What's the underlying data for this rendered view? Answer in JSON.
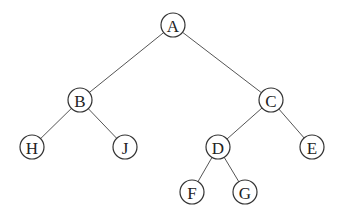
{
  "diagram": {
    "type": "binary-tree",
    "colors": {
      "edge": "#555555",
      "node_stroke": "#333333",
      "node_fill": "#ffffff",
      "text": "#222222"
    },
    "nodes": [
      {
        "id": "A",
        "label": "A",
        "x": 173,
        "y": 25
      },
      {
        "id": "B",
        "label": "B",
        "x": 80,
        "y": 100
      },
      {
        "id": "C",
        "label": "C",
        "x": 271,
        "y": 100
      },
      {
        "id": "H",
        "label": "H",
        "x": 32,
        "y": 147
      },
      {
        "id": "J",
        "label": "J",
        "x": 125,
        "y": 147
      },
      {
        "id": "D",
        "label": "D",
        "x": 218,
        "y": 147
      },
      {
        "id": "E",
        "label": "E",
        "x": 312,
        "y": 147
      },
      {
        "id": "F",
        "label": "F",
        "x": 192,
        "y": 192
      },
      {
        "id": "G",
        "label": "G",
        "x": 245,
        "y": 192
      }
    ],
    "edges": [
      [
        "A",
        "B"
      ],
      [
        "A",
        "C"
      ],
      [
        "B",
        "H"
      ],
      [
        "B",
        "J"
      ],
      [
        "C",
        "D"
      ],
      [
        "C",
        "E"
      ],
      [
        "D",
        "F"
      ],
      [
        "D",
        "G"
      ]
    ]
  }
}
